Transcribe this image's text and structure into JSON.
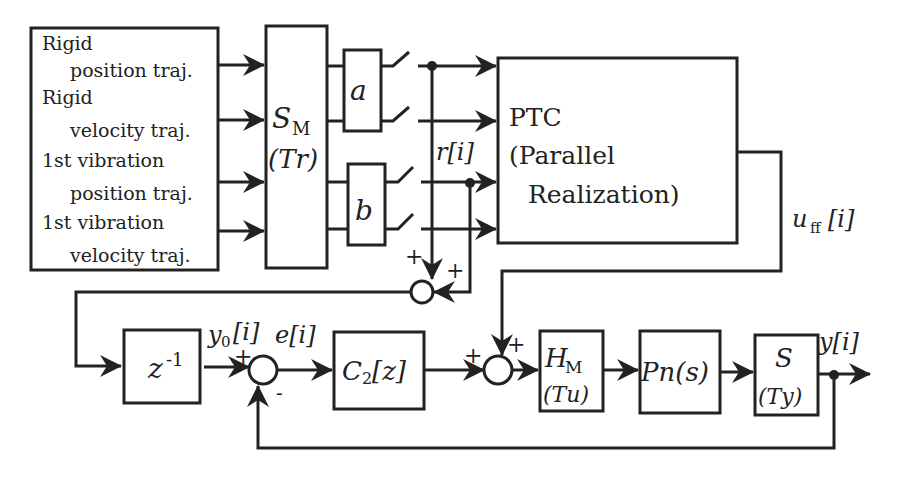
{
  "diagram": {
    "trajectory_box": {
      "lines": [
        "Rigid",
        "position traj.",
        "Rigid",
        "velocity traj.",
        "1st vibration",
        "position traj.",
        "1st vibration",
        "velocity traj."
      ]
    },
    "sampler_block": {
      "main": "S",
      "sub": "M",
      "arg": "(Tr)"
    },
    "gain_a": "a",
    "gain_b": "b",
    "ptc_block": {
      "line1": "PTC",
      "line2": "(Parallel",
      "line3": "Realization)"
    },
    "signals": {
      "r": "r[i]",
      "uff_main": "u",
      "uff_sub": "ff",
      "uff_arg": "[i]",
      "y0_main": "y",
      "y0_sub": "0",
      "y0_arg": "[i]",
      "e": "e[i]",
      "y": "y[i]"
    },
    "delay_block": {
      "main": "z",
      "exp": "-1"
    },
    "controller_block": {
      "main": "C",
      "sub": "2",
      "arg": "[z]"
    },
    "hold_block": {
      "main": "H",
      "sub": "M",
      "arg": "(Tu)"
    },
    "plant_block": "Pn(s)",
    "output_sampler_block": {
      "main": "S",
      "arg": "(Ty)"
    },
    "signs": {
      "sum_top_a": "+",
      "sum_top_b": "+",
      "sum_err_plus": "+",
      "sum_err_minus": "-",
      "sum_ctrl_a": "+",
      "sum_ctrl_b": "+"
    }
  }
}
